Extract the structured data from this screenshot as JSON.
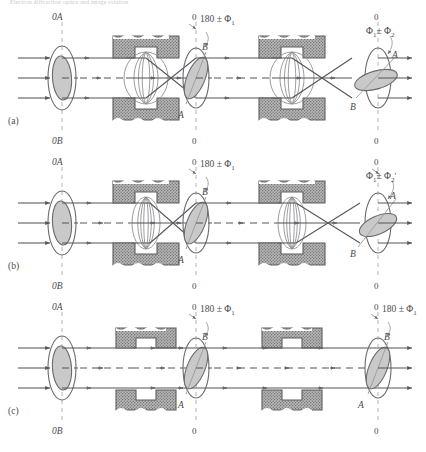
{
  "figure": {
    "top_caption": "Electron diffraction optics and image rotation",
    "rows": [
      {
        "id": "a",
        "row_label": "(a)",
        "object_plane": {
          "top_label": "0A",
          "bottom_label": "0B",
          "marker_a": "A",
          "marker_b": "B"
        },
        "intermediate_plane": {
          "top_label": "0",
          "bottom_label": "0",
          "rotation_label": "180 ± Φ",
          "rotation_sub": "1",
          "marker_a": "A",
          "marker_b": "B"
        },
        "final_plane": {
          "top_label": "0",
          "bottom_label": "0",
          "rotation_label": "Φ",
          "rotation_sub": "1",
          "rotation_label2": "± Φ",
          "rotation_sub2": "2",
          "rotation_prime": "",
          "marker_a": "A",
          "marker_b": "B"
        },
        "lens1_state": "on-strong",
        "lens2_state": "on-strong"
      },
      {
        "id": "b",
        "row_label": "(b)",
        "object_plane": {
          "top_label": "0A",
          "bottom_label": "0B",
          "marker_a": "A",
          "marker_b": "B"
        },
        "intermediate_plane": {
          "top_label": "0",
          "bottom_label": "0",
          "rotation_label": "180 ± Φ",
          "rotation_sub": "1",
          "marker_a": "A",
          "marker_b": "B"
        },
        "final_plane": {
          "top_label": "0",
          "bottom_label": "0",
          "rotation_label": "Φ",
          "rotation_sub": "1",
          "rotation_label2": "± Φ",
          "rotation_sub2": "2",
          "rotation_prime": "′",
          "marker_a": "A",
          "marker_b": "B"
        },
        "lens1_state": "on-weak",
        "lens2_state": "on-weak"
      },
      {
        "id": "c",
        "row_label": "(c)",
        "object_plane": {
          "top_label": "0A",
          "bottom_label": "0B",
          "marker_a": "A",
          "marker_b": "B"
        },
        "intermediate_plane": {
          "top_label": "0",
          "bottom_label": "0",
          "rotation_label": "180 ± Φ",
          "rotation_sub": "1",
          "marker_a": "A",
          "marker_b": "B"
        },
        "final_plane": {
          "top_label": "0",
          "bottom_label": "0",
          "rotation_label": "180 ± Φ",
          "rotation_sub": "1",
          "marker_a": "A",
          "marker_b": "B"
        },
        "lens1_state": "off",
        "lens2_state": "off"
      }
    ],
    "colors": {
      "ray": "#55555a",
      "outline": "#6a6a70",
      "pole_piece": "#8f8f8f",
      "pole_piece_dark": "#5e5e5e",
      "image_fill": "#c9c9c9",
      "axis_dash": "#b3b3b3",
      "text": "#4a4a4a"
    }
  }
}
